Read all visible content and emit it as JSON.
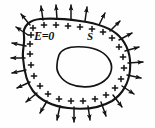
{
  "figure": {
    "kind": "physics-diagram",
    "background_color": "#fefefe",
    "ink_color": "#141414",
    "labels": {
      "interior_field": "E=0",
      "surface": "S",
      "charge_sign": "+"
    },
    "outer_boundary": {
      "name": "conductor-outer-surface",
      "path": "M 24 36 C 22 26 30 20 40 19 C 52 18 66 19 80 21 C 95 23 110 27 119 36 C 128 45 131 58 130 70 C 129 82 123 94 112 101 C 100 108 84 110 68 108 C 52 106 40 100 33 91 C 26 82 24 70 23 58 C 22 50 25 44 24 36 Z"
    },
    "inner_cavity": {
      "name": "cavity-boundary",
      "path": "M 59 55 C 62 48 72 46 84 47 C 96 48 106 53 110 61 C 114 69 110 78 101 83 C 92 88 79 88 70 84 C 61 80 56 72 57 65 C 57 61 58 58 59 55 Z"
    },
    "charges": [
      {
        "x": 33,
        "y": 28
      },
      {
        "x": 44,
        "y": 25
      },
      {
        "x": 56,
        "y": 25
      },
      {
        "x": 68,
        "y": 26
      },
      {
        "x": 80,
        "y": 27
      },
      {
        "x": 92,
        "y": 29
      },
      {
        "x": 103,
        "y": 32
      },
      {
        "x": 112,
        "y": 38
      },
      {
        "x": 119,
        "y": 47
      },
      {
        "x": 123,
        "y": 57
      },
      {
        "x": 124,
        "y": 68
      },
      {
        "x": 121,
        "y": 79
      },
      {
        "x": 115,
        "y": 88
      },
      {
        "x": 106,
        "y": 95
      },
      {
        "x": 95,
        "y": 99
      },
      {
        "x": 83,
        "y": 101
      },
      {
        "x": 71,
        "y": 101
      },
      {
        "x": 59,
        "y": 99
      },
      {
        "x": 48,
        "y": 94
      },
      {
        "x": 40,
        "y": 86
      },
      {
        "x": 34,
        "y": 76
      },
      {
        "x": 31,
        "y": 65
      },
      {
        "x": 30,
        "y": 54
      },
      {
        "x": 30,
        "y": 44
      },
      {
        "x": 31,
        "y": 35
      }
    ],
    "field_arrows": [
      {
        "x1": 30,
        "y1": 25,
        "x2": 21,
        "y2": 14
      },
      {
        "x1": 43,
        "y1": 20,
        "x2": 41,
        "y2": 6
      },
      {
        "x1": 57,
        "y1": 19,
        "x2": 56,
        "y2": 5
      },
      {
        "x1": 71,
        "y1": 20,
        "x2": 71,
        "y2": 5
      },
      {
        "x1": 85,
        "y1": 21,
        "x2": 87,
        "y2": 7
      },
      {
        "x1": 99,
        "y1": 25,
        "x2": 105,
        "y2": 13
      },
      {
        "x1": 110,
        "y1": 31,
        "x2": 120,
        "y2": 21
      },
      {
        "x1": 119,
        "y1": 40,
        "x2": 132,
        "y2": 33
      },
      {
        "x1": 125,
        "y1": 51,
        "x2": 139,
        "y2": 47
      },
      {
        "x1": 128,
        "y1": 63,
        "x2": 143,
        "y2": 62
      },
      {
        "x1": 127,
        "y1": 75,
        "x2": 141,
        "y2": 78
      },
      {
        "x1": 122,
        "y1": 86,
        "x2": 134,
        "y2": 94
      },
      {
        "x1": 113,
        "y1": 95,
        "x2": 122,
        "y2": 107
      },
      {
        "x1": 101,
        "y1": 102,
        "x2": 106,
        "y2": 116
      },
      {
        "x1": 88,
        "y1": 106,
        "x2": 90,
        "y2": 120
      },
      {
        "x1": 74,
        "y1": 107,
        "x2": 74,
        "y2": 122
      },
      {
        "x1": 60,
        "y1": 106,
        "x2": 57,
        "y2": 120
      },
      {
        "x1": 47,
        "y1": 101,
        "x2": 40,
        "y2": 113
      },
      {
        "x1": 37,
        "y1": 93,
        "x2": 26,
        "y2": 102
      },
      {
        "x1": 30,
        "y1": 82,
        "x2": 17,
        "y2": 88
      },
      {
        "x1": 26,
        "y1": 70,
        "x2": 12,
        "y2": 73
      },
      {
        "x1": 25,
        "y1": 58,
        "x2": 11,
        "y2": 58
      },
      {
        "x1": 26,
        "y1": 46,
        "x2": 12,
        "y2": 43
      },
      {
        "x1": 28,
        "y1": 35,
        "x2": 16,
        "y2": 27
      }
    ]
  }
}
